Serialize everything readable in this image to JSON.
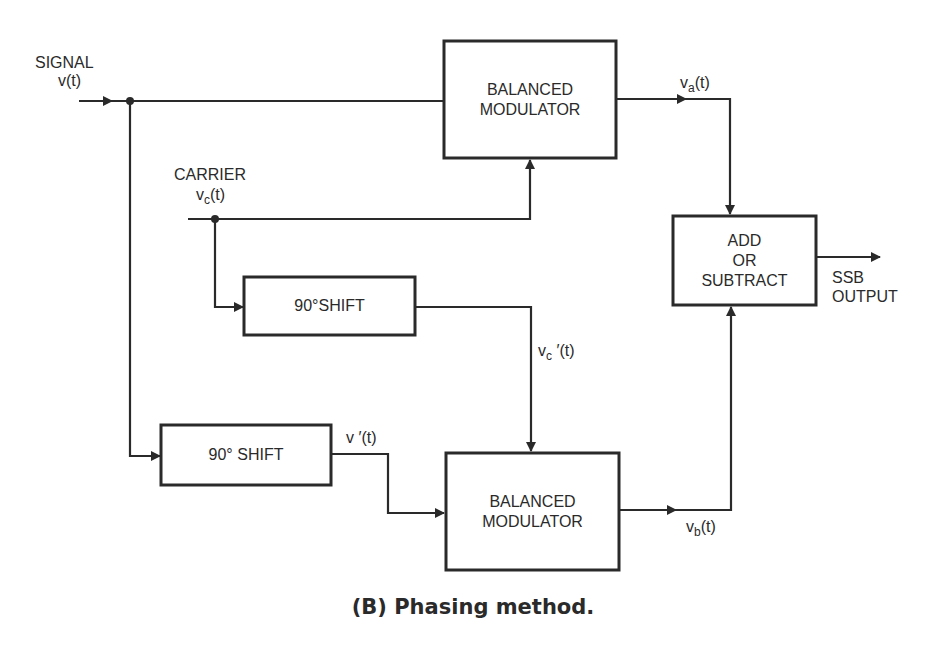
{
  "diagram": {
    "caption": "(B) Phasing method.",
    "inputs": {
      "signal": {
        "label": "SIGNAL",
        "var_base": "v",
        "var_rest": "(t)"
      },
      "carrier": {
        "label": "CARRIER",
        "var_base": "v",
        "var_sub": "c",
        "var_rest": "(t)"
      }
    },
    "blocks": {
      "top_modulator": {
        "line1": "BALANCED",
        "line2": "MODULATOR"
      },
      "bottom_modulator": {
        "line1": "BALANCED",
        "line2": "MODULATOR"
      },
      "carrier_shift": {
        "label": "90°SHIFT"
      },
      "signal_shift": {
        "label": "90° SHIFT"
      },
      "combiner": {
        "line1": "ADD",
        "line2": "OR",
        "line3": "SUBTRACT"
      }
    },
    "signals": {
      "va": {
        "base": "v",
        "sub": "a",
        "rest": "(t)"
      },
      "vb": {
        "base": "v",
        "sub": "b",
        "rest": "(t)"
      },
      "vc_prime": {
        "base": "v",
        "sub": "c",
        "rest": " ′(t)"
      },
      "v_prime": {
        "text": "v ′(t)"
      }
    },
    "output": {
      "line1": "SSB",
      "line2": "OUTPUT"
    },
    "colors": {
      "ink": "#2a2a2a",
      "background": "#ffffff"
    }
  }
}
